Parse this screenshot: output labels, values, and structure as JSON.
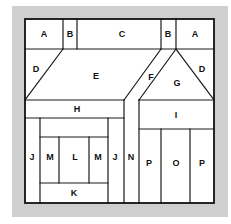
{
  "diagram": {
    "type": "quilt-block-piece-layout",
    "background_frame_color": "#cfcfcf",
    "line_color": "#1a1a1a",
    "pieces": [
      {
        "id": "A-left",
        "label": "A",
        "x": 44,
        "y": 34
      },
      {
        "id": "B-left",
        "label": "B",
        "x": 70,
        "y": 34
      },
      {
        "id": "C",
        "label": "C",
        "x": 122,
        "y": 34
      },
      {
        "id": "B-right",
        "label": "B",
        "x": 168,
        "y": 34
      },
      {
        "id": "A-right",
        "label": "A",
        "x": 195,
        "y": 34
      },
      {
        "id": "D-left",
        "label": "D",
        "x": 36,
        "y": 69
      },
      {
        "id": "E",
        "label": "E",
        "x": 96,
        "y": 76
      },
      {
        "id": "F",
        "label": "F",
        "x": 151,
        "y": 77
      },
      {
        "id": "G",
        "label": "G",
        "x": 177,
        "y": 83
      },
      {
        "id": "D-right",
        "label": "D",
        "x": 202,
        "y": 69
      },
      {
        "id": "H",
        "label": "H",
        "x": 77,
        "y": 109
      },
      {
        "id": "I",
        "label": "I",
        "x": 176,
        "y": 115
      },
      {
        "id": "J-left",
        "label": "J",
        "x": 32,
        "y": 157
      },
      {
        "id": "M-left",
        "label": "M",
        "x": 50,
        "y": 157
      },
      {
        "id": "L",
        "label": "L",
        "x": 75,
        "y": 157
      },
      {
        "id": "M-right",
        "label": "M",
        "x": 98,
        "y": 157
      },
      {
        "id": "J-right",
        "label": "J",
        "x": 115,
        "y": 157
      },
      {
        "id": "N",
        "label": "N",
        "x": 131,
        "y": 157
      },
      {
        "id": "P-left",
        "label": "P",
        "x": 149,
        "y": 163
      },
      {
        "id": "O",
        "label": "O",
        "x": 176,
        "y": 163
      },
      {
        "id": "P-right",
        "label": "P",
        "x": 202,
        "y": 163
      },
      {
        "id": "K",
        "label": "K",
        "x": 74,
        "y": 193
      }
    ]
  }
}
